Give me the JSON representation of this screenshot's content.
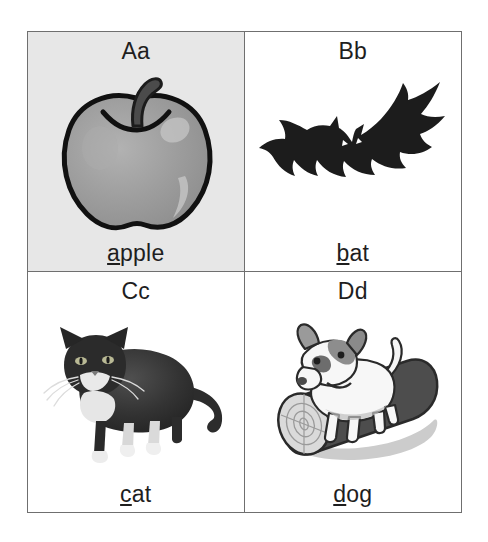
{
  "chart": {
    "title_visible": false,
    "background": "#ffffff",
    "frame_color": "#6f6f6f",
    "cells": [
      {
        "id": "cell-a",
        "letter": "Aa",
        "word_initial": "a",
        "word_rest": "pple",
        "word_full": "apple",
        "picture": "apple-illustration",
        "background": "#e7e7e7",
        "colors": {
          "body": "#9a9a9a",
          "body_light": "#b4b4b4",
          "outline": "#111111",
          "stem": "#4b4b4b",
          "highlight": "#c9c9c9"
        }
      },
      {
        "id": "cell-b",
        "letter": "Bb",
        "word_initial": "b",
        "word_rest": "at",
        "word_full": "bat",
        "picture": "bat-silhouette",
        "background": "#ffffff",
        "colors": {
          "body": "#1c1c1c",
          "eye": "#ffffff"
        }
      },
      {
        "id": "cell-c",
        "letter": "Cc",
        "word_initial": "c",
        "word_rest": "at",
        "word_full": "cat",
        "picture": "cat-photo",
        "background": "#ffffff",
        "colors": {
          "fur_dark": "#2b2b2b",
          "fur_mid": "#4a4a4a",
          "fur_white": "#f0f0f0",
          "eye": "#c9c9a0"
        }
      },
      {
        "id": "cell-d",
        "letter": "Dd",
        "word_initial": "d",
        "word_rest": "og",
        "word_full": "dog",
        "picture": "dog-on-log-illustration",
        "background": "#ffffff",
        "colors": {
          "dog_body": "#f7f7f7",
          "dog_patch": "#8d8d8d",
          "dog_patch_dark": "#4f4f4f",
          "outline": "#2a2a2a",
          "log": "#4a4a4a",
          "log_end": "#d8d8d8",
          "shadow": "#c4c4c4"
        }
      }
    ]
  }
}
